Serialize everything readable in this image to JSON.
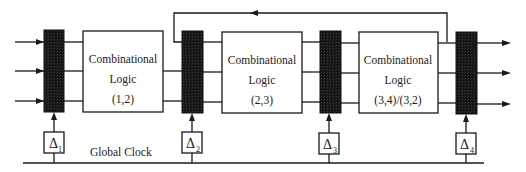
{
  "diagram": {
    "colors": {
      "stroke": "#1a1a1a",
      "register_fill": "#1c1c1c",
      "box_fill": "#ffffff"
    },
    "registers": [
      {
        "id": "R1",
        "x": 44,
        "delay_label": "Δ",
        "delay_sub": "1"
      },
      {
        "id": "R2",
        "x": 182,
        "delay_label": "Δ",
        "delay_sub": "2"
      },
      {
        "id": "R3",
        "x": 320,
        "delay_label": "Δ",
        "delay_sub": "3"
      },
      {
        "id": "R4",
        "x": 456,
        "delay_label": "Δ",
        "delay_sub": "4"
      }
    ],
    "logic_blocks": [
      {
        "id": "CL1",
        "x": 83,
        "line1": "Combinational",
        "line2": "Logic",
        "line3": "(1,2)"
      },
      {
        "id": "CL2",
        "x": 222,
        "line1": "Combinational",
        "line2": "Logic",
        "line3": "(2,3)"
      },
      {
        "id": "CL3",
        "x": 359,
        "line1": "Combinational",
        "line2": "Logic",
        "line3": "(3,4)/(3,2)"
      }
    ],
    "clock_label": "Global Clock"
  }
}
